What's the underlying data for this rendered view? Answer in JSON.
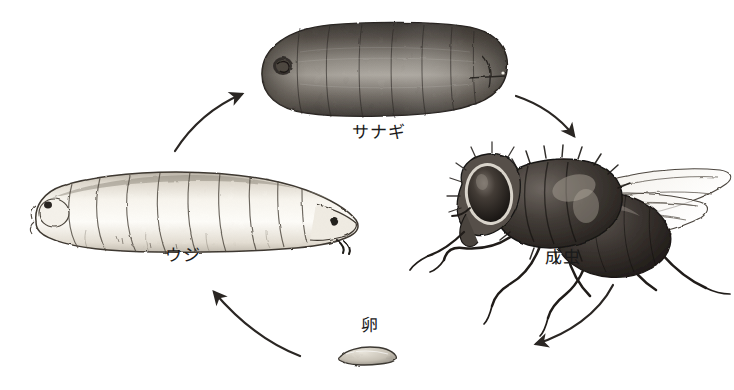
{
  "diagram": {
    "type": "life-cycle-diagram",
    "background_color": "#ffffff",
    "ink_color": "#262220",
    "stages": [
      {
        "id": "pupa",
        "label": "サナギ",
        "romaji": "sanagi",
        "english": "pupa",
        "order": 3,
        "illustration": "dark barrel-shaped puparium, segmented, shaded",
        "label_position": {
          "x": 352,
          "y": 125
        },
        "art_bounds": {
          "x": 258,
          "y": 22,
          "w": 252,
          "h": 100
        }
      },
      {
        "id": "larva",
        "label": "ウジ",
        "romaji": "uji",
        "english": "maggot / larva",
        "order": 2,
        "illustration": "pale segmented maggot, head tapering to the right with dark mouth hooks",
        "label_position": {
          "x": 165,
          "y": 248
        },
        "art_bounds": {
          "x": 28,
          "y": 168,
          "w": 330,
          "h": 90
        }
      },
      {
        "id": "adult",
        "label": "成虫",
        "romaji": "seichu",
        "english": "adult fly",
        "order": 4,
        "illustration": "adult housefly facing left, large dark compound eye, hairy thorax, two veined translucent wings, six legs",
        "label_position": {
          "x": 545,
          "y": 250
        },
        "art_bounds": {
          "x": 444,
          "y": 148,
          "w": 290,
          "h": 160
        }
      },
      {
        "id": "egg",
        "label": "卵",
        "romaji": "tamago",
        "english": "egg",
        "order": 1,
        "illustration": "small flat elongated pale oval egg with dark outline",
        "label_position": {
          "x": 361,
          "y": 318
        },
        "art_bounds": {
          "x": 338,
          "y": 350,
          "w": 58,
          "h": 14
        }
      }
    ],
    "arrows": [
      {
        "id": "larva-to-pupa",
        "from": "larva",
        "to": "pupa",
        "direction": "up-right",
        "style": "curved-solid"
      },
      {
        "id": "pupa-to-adult",
        "from": "pupa",
        "to": "adult",
        "direction": "down-right",
        "style": "curved-solid"
      },
      {
        "id": "adult-to-egg",
        "from": "adult",
        "to": "egg",
        "direction": "down-left",
        "style": "curved-solid"
      },
      {
        "id": "egg-to-larva",
        "from": "egg",
        "to": "larva",
        "direction": "up-left",
        "style": "curved-solid"
      }
    ]
  }
}
